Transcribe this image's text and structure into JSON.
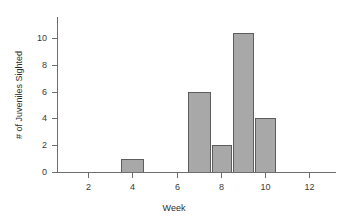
{
  "chart_data": {
    "type": "bar",
    "title": "",
    "subtitle": "",
    "xlabel": "Week",
    "ylabel": "# of Juveniles Sighted",
    "x": [
      7,
      8,
      9,
      10,
      4
    ],
    "categories": [
      "4",
      "7",
      "8",
      "9",
      "10"
    ],
    "values": [
      1,
      6,
      2,
      10.4,
      4
    ],
    "bars": [
      {
        "week": 4,
        "value": 1,
        "left": 3.5,
        "right": 4.5
      },
      {
        "week": 7,
        "value": 6,
        "left": 6.5,
        "right": 7.5
      },
      {
        "week": 8,
        "value": 2,
        "left": 7.6,
        "right": 8.45
      },
      {
        "week": 9,
        "value": 10.4,
        "left": 8.55,
        "right": 9.45
      },
      {
        "week": 10,
        "value": 4,
        "left": 9.55,
        "right": 10.45
      }
    ],
    "xlim": [
      0.6,
      13.2
    ],
    "ylim": [
      0,
      11.2
    ],
    "xticks": [
      2,
      4,
      6,
      8,
      10,
      12
    ],
    "xtick_labels": [
      "2",
      "4",
      "6",
      "8",
      "10",
      "12"
    ],
    "yticks": [
      0,
      2,
      4,
      6,
      8,
      10
    ],
    "ytick_labels": [
      "0",
      "2",
      "4",
      "6",
      "8",
      "10"
    ],
    "grid": false,
    "legend": false,
    "legend_position": "none",
    "bar_fill_color": "#a8a8a8",
    "bar_edge_color": "#5d5d5d",
    "axis_color": "#6e6e6e",
    "text_color": "#2e2e2e",
    "background_color": "#ffffff"
  }
}
